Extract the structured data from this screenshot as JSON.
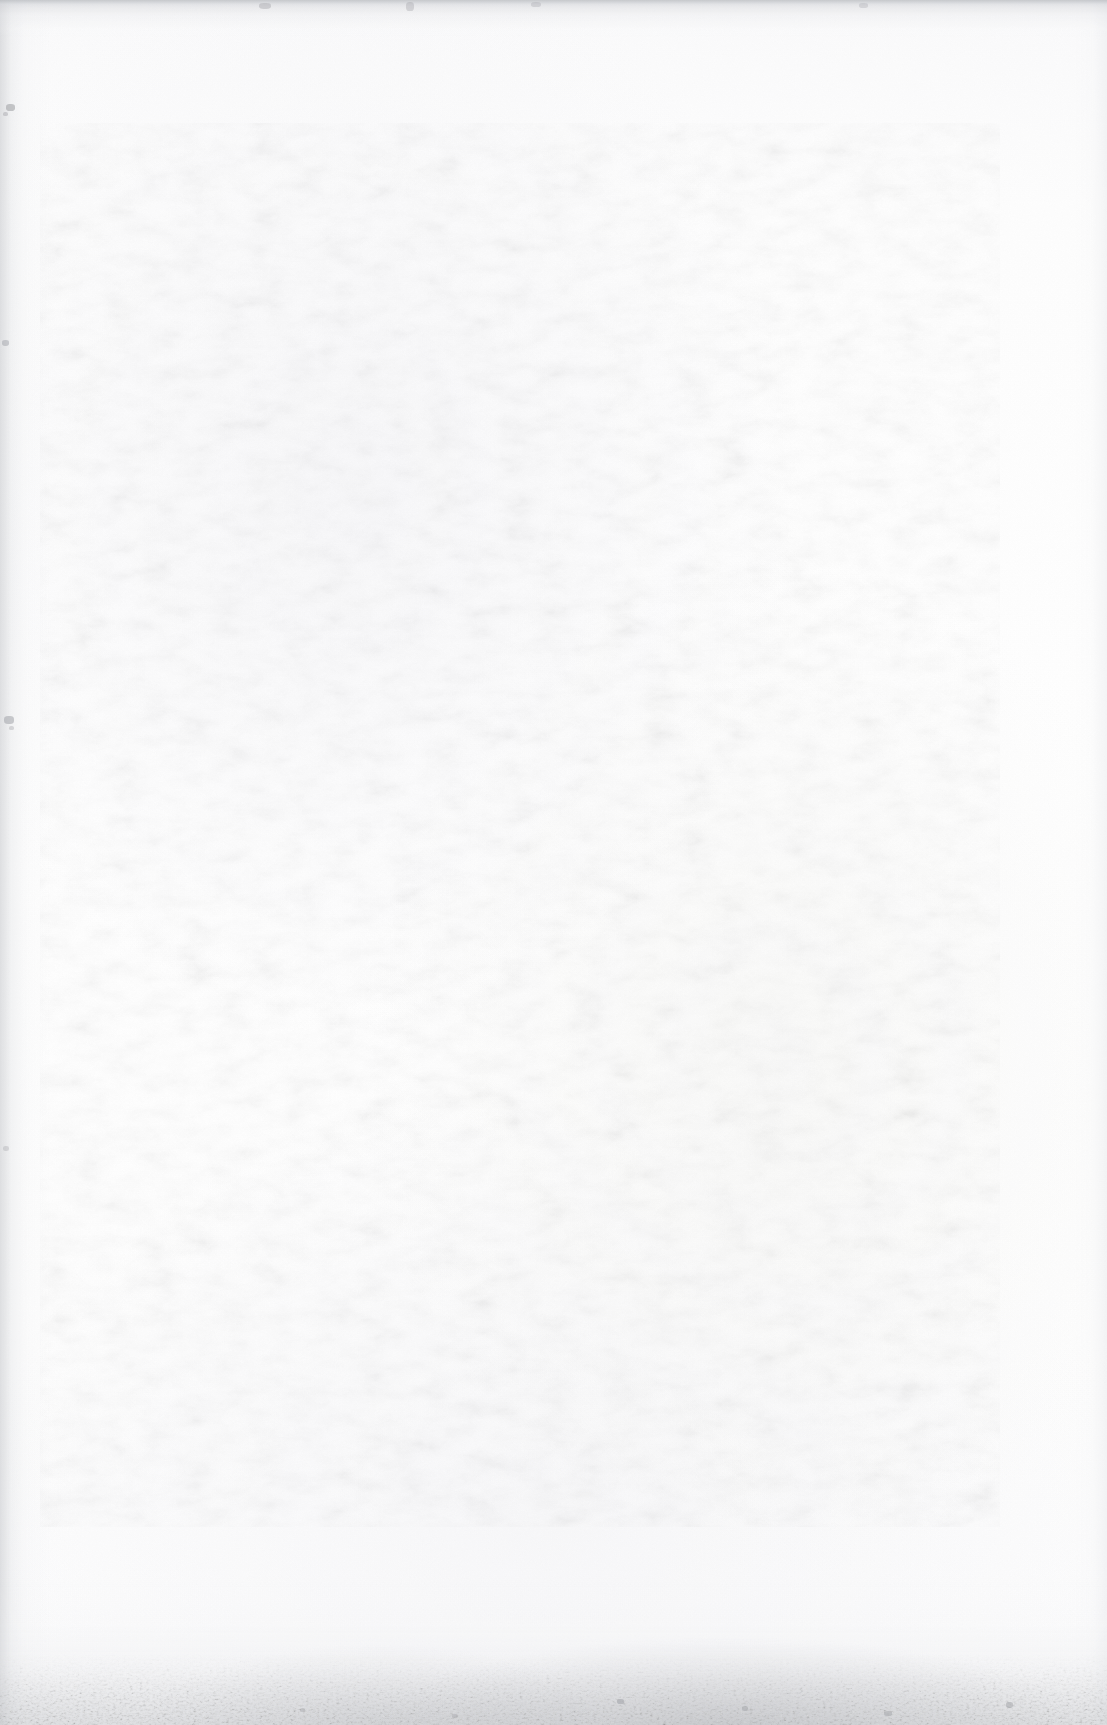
{
  "document": {
    "kind": "scanned-page",
    "content_type": "blank",
    "visible_text": "",
    "page_width_px": 1107,
    "page_height_px": 1725
  },
  "appearance": {
    "paper_color": "#fcfcfc",
    "paper_color_light": "#fefefe",
    "paper_color_shade": "#f7f7f9",
    "edge_shadow_color": "#c4c6ca",
    "scan_band_color": "#b4b7bc",
    "grime_color": "#8d9095",
    "speck_color": "#9a9ca1"
  },
  "regions": {
    "left_edge_vignette": {
      "x": 0,
      "y": 0,
      "width": 52,
      "height": 1725
    },
    "top_edge_vignette": {
      "x": 0,
      "y": 0,
      "width": 1107,
      "height": 38
    },
    "top_scan_band": {
      "x": 0,
      "y": 0,
      "width": 1107,
      "height": 7
    },
    "right_edge_vignette": {
      "x": 1073,
      "y": 0,
      "width": 34,
      "height": 1725
    },
    "bottom_edge_vignette": {
      "x": 0,
      "y": 1575,
      "width": 1107,
      "height": 150
    },
    "bottom_grime_band": {
      "x": 0,
      "y": 1653,
      "width": 1107,
      "height": 72
    }
  },
  "marks": {
    "specks": [
      {
        "x": 6,
        "y": 104,
        "w": 9,
        "h": 7,
        "opacity": 0.55
      },
      {
        "x": 3,
        "y": 112,
        "w": 5,
        "h": 4,
        "opacity": 0.4
      },
      {
        "x": 2,
        "y": 340,
        "w": 7,
        "h": 6,
        "opacity": 0.45
      },
      {
        "x": 4,
        "y": 716,
        "w": 10,
        "h": 8,
        "opacity": 0.5
      },
      {
        "x": 9,
        "y": 726,
        "w": 5,
        "h": 4,
        "opacity": 0.35
      },
      {
        "x": 3,
        "y": 1146,
        "w": 6,
        "h": 5,
        "opacity": 0.32
      },
      {
        "x": 259,
        "y": 3,
        "w": 12,
        "h": 6,
        "opacity": 0.38
      },
      {
        "x": 406,
        "y": 2,
        "w": 8,
        "h": 9,
        "opacity": 0.34
      },
      {
        "x": 531,
        "y": 2,
        "w": 10,
        "h": 5,
        "opacity": 0.3
      },
      {
        "x": 859,
        "y": 3,
        "w": 9,
        "h": 5,
        "opacity": 0.28
      },
      {
        "x": 617,
        "y": 1699,
        "w": 7,
        "h": 5,
        "opacity": 0.5
      },
      {
        "x": 742,
        "y": 1706,
        "w": 6,
        "h": 5,
        "opacity": 0.46
      },
      {
        "x": 884,
        "y": 1711,
        "w": 8,
        "h": 5,
        "opacity": 0.44
      },
      {
        "x": 1006,
        "y": 1702,
        "w": 7,
        "h": 6,
        "opacity": 0.48
      },
      {
        "x": 452,
        "y": 1714,
        "w": 6,
        "h": 4,
        "opacity": 0.4
      },
      {
        "x": 300,
        "y": 1708,
        "w": 5,
        "h": 4,
        "opacity": 0.36
      }
    ],
    "ghost_patches": [
      {
        "x": 330,
        "y": 240,
        "w": 250,
        "h": 130,
        "opacity": 0.3
      },
      {
        "x": 520,
        "y": 940,
        "w": 330,
        "h": 300,
        "opacity": 0.26
      },
      {
        "x": 690,
        "y": 560,
        "w": 230,
        "h": 200,
        "opacity": 0.22
      },
      {
        "x": 120,
        "y": 1230,
        "w": 260,
        "h": 180,
        "opacity": 0.18
      }
    ]
  }
}
